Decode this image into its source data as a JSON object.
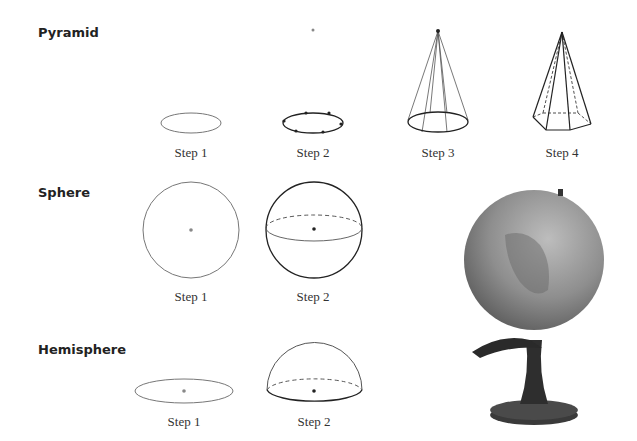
{
  "sections": {
    "pyramid": {
      "title": "Pyramid",
      "steps": [
        "Step 1",
        "Step 2",
        "Step 3",
        "Step 4"
      ]
    },
    "sphere": {
      "title": "Sphere",
      "steps": [
        "Step 1",
        "Step 2"
      ]
    },
    "hemisphere": {
      "title": "Hemisphere",
      "steps": [
        "Step 1",
        "Step 2"
      ]
    }
  },
  "photo": {
    "subject": "globe-on-stand"
  },
  "colors": {
    "line_dark": "#222222",
    "line_light": "#777777"
  }
}
